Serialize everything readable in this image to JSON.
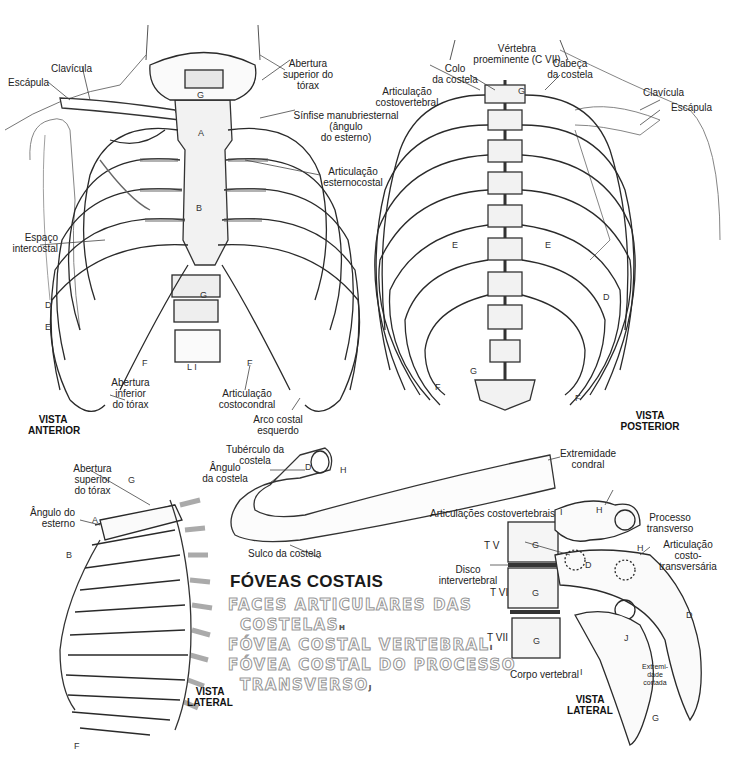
{
  "diagram": {
    "anterior": {
      "view_label": [
        "VISTA",
        "ANTERIOR"
      ],
      "labels": {
        "clavicula": "Clavícula",
        "escapula": "Escápula",
        "abertura_superior": [
          "Abertura",
          "superior do",
          "tórax"
        ],
        "sinfise": [
          "Sínfise manubriesternal",
          "(ângulo",
          "do esterno)"
        ],
        "articulacao_esternocostal": [
          "Articulação",
          "esternocostal"
        ],
        "espaco_intercostal": [
          "Espaço",
          "intercostal"
        ],
        "abertura_inferior": [
          "Abertura",
          "inferior",
          "do tórax"
        ],
        "articulacao_costocondral": [
          "Articulação",
          "costocondral"
        ],
        "arco_costal": [
          "Arco costal",
          "esquerdo"
        ]
      },
      "letters": [
        "A",
        "B",
        "C",
        "D",
        "E",
        "E'",
        "F",
        "G",
        "L I"
      ]
    },
    "posterior": {
      "view_label": [
        "VISTA",
        "POSTERIOR"
      ],
      "labels": {
        "vertebra_proeminente": [
          "Vértebra",
          "proeminente (C VII)"
        ],
        "colo_costela": [
          "Colo",
          "da costela"
        ],
        "cabeca_costela": [
          "Cabeça",
          "da costela"
        ],
        "articulacao_costovertebral": [
          "Articulação",
          "costovertebral"
        ],
        "clavicula": "Clavícula",
        "escapula": "Escápula"
      },
      "letters": [
        "D",
        "E",
        "F",
        "G"
      ]
    },
    "lateral_thorax": {
      "view_label": [
        "VISTA",
        "LATERAL"
      ],
      "labels": {
        "abertura_superior": [
          "Abertura",
          "superior",
          "do tórax"
        ],
        "angulo_esterno": [
          "Ângulo do",
          "esterno"
        ]
      },
      "letters": [
        "A",
        "B",
        "D",
        "E",
        "F",
        "G"
      ]
    },
    "rib": {
      "labels": {
        "tuberculo": [
          "Tubérculo da",
          "costela"
        ],
        "angulo": [
          "Ângulo",
          "da costela"
        ],
        "extremidade_condral": [
          "Extremidade",
          "condral"
        ],
        "sulco": "Sulco da costela"
      },
      "letters": [
        "D",
        "H"
      ]
    },
    "lateral_vertebrae": {
      "view_label": [
        "VISTA",
        "LATERAL"
      ],
      "labels": {
        "articulacoes_costovertebrais": "Articulações costovertebrais",
        "processo_transverso": [
          "Processo",
          "transverso"
        ],
        "articulacao_costotransversaria": [
          "Articulação",
          "costo-",
          "transversária"
        ],
        "disco_intervertebral": [
          "Disco",
          "intervertebral"
        ],
        "corpo_vertebral": "Corpo vertebral",
        "extremidade_cortada": [
          "Extremi-",
          "dade",
          "cortada"
        ],
        "tv": "T V",
        "tvi": "T VI",
        "tvii": "T VII"
      },
      "letters": [
        "D",
        "G",
        "H",
        "I",
        "J"
      ]
    },
    "legend": {
      "title": "FÓVEAS COSTAIS",
      "items": [
        {
          "text": "FACES ARTICULARES DAS",
          "sub": ""
        },
        {
          "text": "COSTELAS",
          "sub": "H"
        },
        {
          "text": "FÓVEA COSTAL VERTEBRAL",
          "sub": "I"
        },
        {
          "text": "FÓVEA COSTAL DO PROCESSO",
          "sub": ""
        },
        {
          "text": "TRANSVERSO",
          "sub": "J"
        }
      ]
    }
  }
}
